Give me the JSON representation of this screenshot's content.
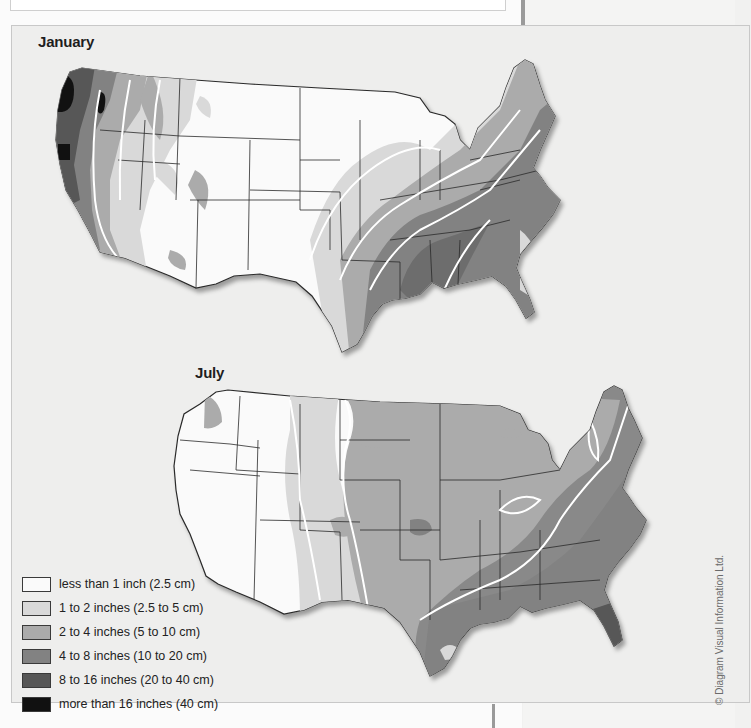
{
  "page": {
    "caption_fragment": "",
    "copyright": "© Diagram Visual Information Ltd."
  },
  "maps": [
    {
      "id": "january",
      "title": "January",
      "description": "Average monthly precipitation, contiguous United States, January",
      "pattern_notes": "Wettest along Pacific Northwest coast (more than 16 inches) and Gulf Coast/lower Mississippi valley (4 to 16 inches); driest across Great Plains, Rockies and Southwest (less than 1 inch)"
    },
    {
      "id": "july",
      "title": "July",
      "description": "Average monthly precipitation, contiguous United States, July",
      "pattern_notes": "Driest across the West (less than 1 inch); wettest across the Southeast and Gulf Coast (4 to 8 inches, locally 8 to 16 in Florida); central plains and Midwest 2 to 4 inches"
    }
  ],
  "legend": {
    "items": [
      {
        "label": "less than 1 inch (2.5 cm)",
        "color": "#fafafa"
      },
      {
        "label": "1 to 2 inches (2.5 to 5 cm)",
        "color": "#d9d9d9"
      },
      {
        "label": "2 to 4 inches (5 to 10 cm)",
        "color": "#ababab"
      },
      {
        "label": "4 to 8 inches (10 to 20 cm)",
        "color": "#828282"
      },
      {
        "label": "8 to 16 inches (20 to 40 cm)",
        "color": "#575757"
      },
      {
        "label": "more than 16 inches (40 cm)",
        "color": "#111111"
      }
    ]
  },
  "colors": {
    "panel_background": "#eeeeed",
    "state_border": "#2a2a2a",
    "contour_line": "#ffffff"
  }
}
